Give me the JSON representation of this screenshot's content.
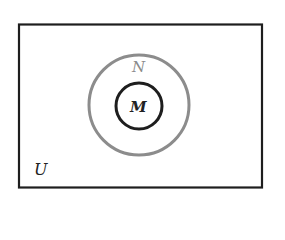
{
  "diagram": {
    "type": "venn",
    "universe": {
      "label": "U",
      "border_color": "#1e1e1e"
    },
    "sets": [
      {
        "label": "N",
        "border_color": "#8c8c8c",
        "contains": [
          "M"
        ]
      },
      {
        "label": "M",
        "border_color": "#1e1e1e",
        "contains": []
      }
    ],
    "relationship": "M ⊆ N ⊆ U"
  }
}
